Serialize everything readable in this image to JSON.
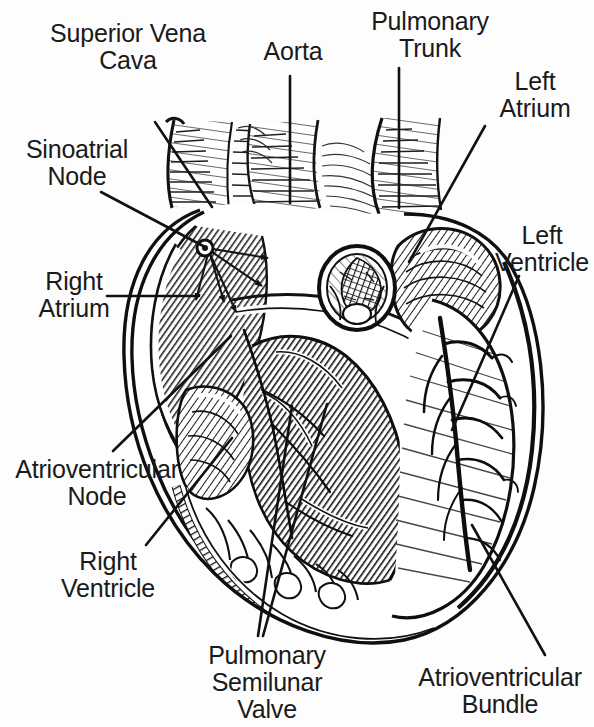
{
  "figure": {
    "style": "black and white pen-and-ink anatomical line drawing",
    "background_color": "#ffffff",
    "ink_color": "#1a1a1a",
    "width": 594,
    "height": 727
  },
  "labels": {
    "superior_vena_cava": "Superior Vena\nCava",
    "aorta": "Aorta",
    "pulmonary_trunk": "Pulmonary\nTrunk",
    "left_atrium": "Left\nAtrium",
    "sinoatrial_node": "Sinoatrial\nNode",
    "left_ventricle": "Left\nVentricle",
    "right_atrium": "Right\nAtrium",
    "atrioventricular_node": "Atrioventricular\nNode",
    "right_ventricle": "Right\nVentricle",
    "pulmonary_semilunar_valve": "Pulmonary\nSemilunar\nValve",
    "atrioventricular_bundle": "Atrioventricular\nBundle"
  },
  "leader_lines": [
    {
      "name": "superior-vena-cava-leader",
      "x1": 155,
      "y1": 122,
      "x2": 212,
      "y2": 207
    },
    {
      "name": "aorta-leader",
      "x1": 290,
      "y1": 76,
      "x2": 290,
      "y2": 203
    },
    {
      "name": "pulmonary-trunk-leader",
      "x1": 399,
      "y1": 68,
      "x2": 399,
      "y2": 208
    },
    {
      "name": "left-atrium-leader",
      "x1": 485,
      "y1": 126,
      "x2": 409,
      "y2": 262
    },
    {
      "name": "sinoatrial-node-leader",
      "x1": 101,
      "y1": 192,
      "x2": 205,
      "y2": 247
    },
    {
      "name": "left-ventricle-leader",
      "x1": 519,
      "y1": 276,
      "x2": 452,
      "y2": 430
    },
    {
      "name": "right-atrium-leader",
      "x1": 107,
      "y1": 296,
      "x2": 199,
      "y2": 296
    },
    {
      "name": "atrioventricular-node-leader",
      "x1": 113,
      "y1": 451,
      "x2": 231,
      "y2": 336
    },
    {
      "name": "right-ventricle-leader",
      "x1": 146,
      "y1": 545,
      "x2": 232,
      "y2": 438
    },
    {
      "name": "pulmonary-semilunar-valve-leader-a",
      "x1": 258,
      "y1": 636,
      "x2": 292,
      "y2": 406
    },
    {
      "name": "pulmonary-semilunar-valve-leader-b",
      "x1": 263,
      "y1": 636,
      "x2": 327,
      "y2": 404
    },
    {
      "name": "atrioventricular-bundle-leader",
      "x1": 545,
      "y1": 655,
      "x2": 472,
      "y2": 525
    }
  ],
  "conduction_arrows": {
    "name": "sa-node-impulse-arrows",
    "origin": {
      "x": 205,
      "y": 248
    },
    "count": 5
  },
  "structures": [
    "superior vena cava",
    "aorta",
    "pulmonary trunk",
    "left atrium",
    "right atrium",
    "left ventricle",
    "right ventricle",
    "sinoatrial node",
    "atrioventricular node",
    "atrioventricular bundle",
    "pulmonary semilunar valve",
    "interventricular septum",
    "chordae tendineae",
    "papillary muscles",
    "coronary vessels"
  ]
}
